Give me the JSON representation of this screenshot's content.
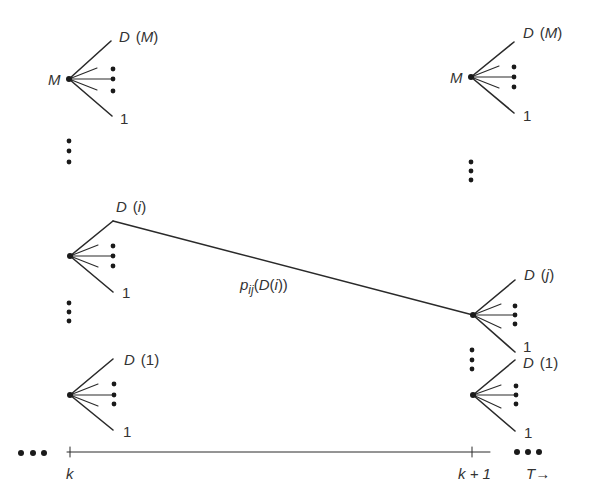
{
  "diagram": {
    "colors": {
      "ink": "#2a2a2a",
      "text": "#333333",
      "background": "#ffffff"
    },
    "stages": [
      {
        "id": "k",
        "label": "k"
      },
      {
        "id": "k1",
        "label": "k + 1"
      }
    ],
    "time_label": "T",
    "time_arrow": "→",
    "nodes": [
      {
        "id": "left-M",
        "stage": "k",
        "state_label": "M",
        "top_label": "D",
        "top_arg": "M",
        "bottom_label": "1"
      },
      {
        "id": "left-i",
        "stage": "k",
        "state_label": "",
        "top_label": "D",
        "top_arg": "i",
        "bottom_label": "1"
      },
      {
        "id": "left-1",
        "stage": "k",
        "state_label": "",
        "top_label": "D",
        "top_arg": "1",
        "bottom_label": "1"
      },
      {
        "id": "right-M",
        "stage": "k1",
        "state_label": "M",
        "top_label": "D",
        "top_arg": "M",
        "bottom_label": "1"
      },
      {
        "id": "right-j",
        "stage": "k1",
        "state_label": "",
        "top_label": "D",
        "top_arg": "j",
        "bottom_label": "1"
      },
      {
        "id": "right-1",
        "stage": "k1",
        "state_label": "",
        "top_label": "D",
        "top_arg": "1",
        "bottom_label": "1"
      }
    ],
    "transition": {
      "from": "left-i",
      "to": "right-j",
      "label_main": "p",
      "label_sub": "ij",
      "label_arg": "(D(i))"
    }
  }
}
